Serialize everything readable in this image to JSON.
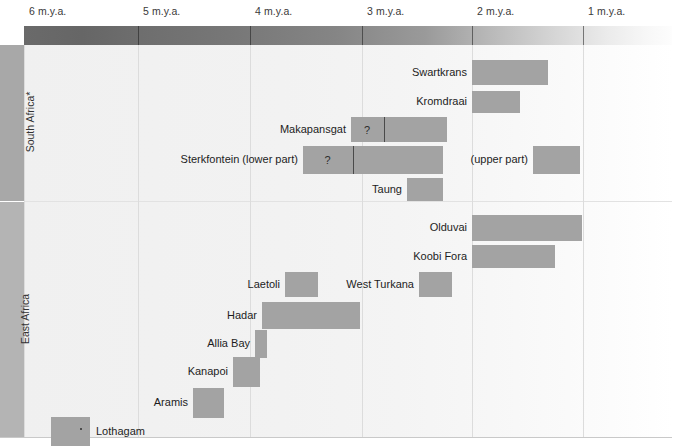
{
  "figure": {
    "width": 690,
    "height": 447,
    "title": "",
    "colors": {
      "bar": "#a3a3a3",
      "region_strip_south": "#a8a8a8",
      "region_strip_east": "#b4b4b4",
      "gridline": "#dcdcdc",
      "band_old": "#6a6a6a",
      "band_recent": "#ffffff"
    }
  },
  "axis": {
    "unit": "m.y.a.",
    "ticks": [
      {
        "label": "6 m.y.a.",
        "value": 6,
        "x": 24
      },
      {
        "label": "5 m.y.a.",
        "value": 5,
        "x": 138
      },
      {
        "label": "4 m.y.a.",
        "value": 4,
        "x": 250
      },
      {
        "label": "3 m.y.a.",
        "value": 3,
        "x": 362
      },
      {
        "label": "2 m.y.a.",
        "value": 2,
        "x": 472
      },
      {
        "label": "1 m.y.a.",
        "value": 1,
        "x": 583
      }
    ],
    "direction": "older-to-younger-left-to-right",
    "range_mya": [
      6.2,
      0.2
    ]
  },
  "regions": [
    {
      "name": "south-africa",
      "label": "South Africa*",
      "top": 0,
      "height": 156
    },
    {
      "name": "east-africa",
      "label": "East Africa",
      "top": 157,
      "height": 235
    }
  ],
  "chart_data": {
    "type": "bar",
    "orientation": "horizontal-ranges",
    "title": "",
    "xlabel": "Millions of years ago (m.y.a.)",
    "ylabel": "",
    "xlim": [
      6.2,
      0.2
    ],
    "grid": true,
    "legend": null,
    "groups": [
      {
        "region": "South Africa*",
        "sites": [
          {
            "name": "Swartkrans",
            "label": "Swartkrans",
            "label_side": "left",
            "start_mya": 2.0,
            "end_mya": 1.3,
            "x": 472,
            "w": 76,
            "y": 15,
            "h": 25,
            "uncertain": false,
            "segments": []
          },
          {
            "name": "Kromdraai",
            "label": "Kromdraai",
            "label_side": "left",
            "start_mya": 2.0,
            "end_mya": 1.6,
            "x": 472,
            "w": 48,
            "y": 46,
            "h": 22,
            "uncertain": false,
            "segments": []
          },
          {
            "name": "Makapansgat",
            "label": "Makapansgat",
            "label_side": "left",
            "start_mya": 3.1,
            "end_mya": 2.3,
            "x": 351,
            "w": 96,
            "y": 72,
            "h": 25,
            "uncertain": true,
            "uncertain_marker": "?",
            "segments": [
              {
                "x": 351,
                "w": 32,
                "marker": "?"
              },
              {
                "x": 384,
                "w": 63,
                "marker": ""
              }
            ]
          },
          {
            "name": "Sterkfontein-lower",
            "label": "Sterkfontein (lower part)",
            "label_side": "left",
            "start_mya": 3.3,
            "end_mya": 2.4,
            "x": 303,
            "w": 140,
            "y": 101,
            "h": 28,
            "uncertain": true,
            "uncertain_marker": "?",
            "segments": [
              {
                "x": 303,
                "w": 49,
                "marker": "?"
              },
              {
                "x": 353,
                "w": 90,
                "marker": ""
              }
            ]
          },
          {
            "name": "Sterkfontein-upper",
            "label": "(upper part)",
            "label_side": "left",
            "start_mya": 1.6,
            "end_mya": 1.1,
            "x": 533,
            "w": 47,
            "y": 101,
            "h": 28,
            "uncertain": false,
            "segments": []
          },
          {
            "name": "Taung",
            "label": "Taung",
            "label_side": "left",
            "start_mya": 2.7,
            "end_mya": 2.4,
            "x": 407,
            "w": 36,
            "y": 133,
            "h": 23,
            "uncertain": false,
            "segments": []
          }
        ]
      },
      {
        "region": "East Africa",
        "sites": [
          {
            "name": "Olduvai",
            "label": "Olduvai",
            "label_side": "left",
            "start_mya": 2.0,
            "end_mya": 1.05,
            "x": 472,
            "w": 110,
            "y": 13,
            "h": 26,
            "uncertain": false,
            "segments": []
          },
          {
            "name": "Koobi-Fora",
            "label": "Koobi Fora",
            "label_side": "left",
            "start_mya": 2.0,
            "end_mya": 1.3,
            "x": 472,
            "w": 83,
            "y": 43,
            "h": 23,
            "uncertain": false,
            "segments": []
          },
          {
            "name": "Laetoli",
            "label": "Laetoli",
            "label_side": "left",
            "start_mya": 3.8,
            "end_mya": 3.5,
            "x": 285,
            "w": 33,
            "y": 70,
            "h": 25,
            "uncertain": false,
            "segments": []
          },
          {
            "name": "West-Turkana",
            "label": "West Turkana",
            "label_side": "left",
            "start_mya": 2.6,
            "end_mya": 2.4,
            "x": 419,
            "w": 33,
            "y": 70,
            "h": 25,
            "uncertain": false,
            "segments": []
          },
          {
            "name": "Hadar",
            "label": "Hadar",
            "label_side": "left",
            "start_mya": 3.5,
            "end_mya": 2.8,
            "x": 262,
            "w": 98,
            "y": 100,
            "h": 27,
            "uncertain": false,
            "segments": []
          },
          {
            "name": "Allia-Bay",
            "label": "Allia Bay",
            "label_side": "left",
            "start_mya": 3.9,
            "end_mya": 3.8,
            "x": 255,
            "w": 12,
            "y": 128,
            "h": 28,
            "uncertain": false,
            "segments": []
          },
          {
            "name": "Kanapoi",
            "label": "Kanapoi",
            "label_side": "left",
            "start_mya": 4.2,
            "end_mya": 3.9,
            "x": 233,
            "w": 27,
            "y": 155,
            "h": 30,
            "uncertain": false,
            "segments": []
          },
          {
            "name": "Aramis",
            "label": "Aramis",
            "label_side": "left",
            "start_mya": 4.5,
            "end_mya": 4.3,
            "x": 193,
            "w": 31,
            "y": 186,
            "h": 30,
            "uncertain": false,
            "segments": []
          },
          {
            "name": "Lothagam",
            "label": "Lothagam",
            "label_side": "right",
            "start_mya": 5.7,
            "end_mya": 5.4,
            "x": 51,
            "w": 39,
            "y": 215,
            "h": 29,
            "uncertain": false,
            "segments": []
          }
        ]
      }
    ]
  }
}
